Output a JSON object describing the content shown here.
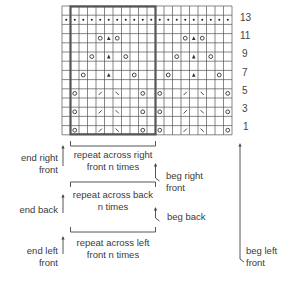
{
  "chart": {
    "columns": 20,
    "rows": 14,
    "repeat": {
      "start_col": 1,
      "end_col": 10
    },
    "row_numbers": [
      "13",
      "11",
      "9",
      "7",
      "5",
      "3",
      "1"
    ],
    "symbols": {
      "dot": "purl / bobble dot",
      "o": "yarn over",
      "a": "double decrease",
      "slash": "k2tog",
      "backslash": "ssk"
    },
    "pattern_rows": [
      {
        "row": 14,
        "cells": ""
      },
      {
        "row": 13,
        "cells": "dots-all"
      },
      {
        "row": 12,
        "cells": ""
      },
      {
        "row": 11,
        "cells": "O col 4,14; A col 5,15; O col 6,16"
      },
      {
        "row": 10,
        "cells": ""
      },
      {
        "row": 9,
        "cells": "O col 3,13; A col 5,15; O col 7,17"
      },
      {
        "row": 8,
        "cells": ""
      },
      {
        "row": 7,
        "cells": "O col 2,12; A col 5,15; O col 8,18"
      },
      {
        "row": 6,
        "cells": ""
      },
      {
        "row": 5,
        "cells": "O col 1,11; / col 4,14; \\ col 6,16; O col 9,19"
      },
      {
        "row": 4,
        "cells": ""
      },
      {
        "row": 3,
        "cells": "O col 1,11; / col 4,14; \\ col 6,16; O col 9,19"
      },
      {
        "row": 2,
        "cells": ""
      },
      {
        "row": 1,
        "cells": "O col 1,11; / col 4,14; \\ col 6,16; O col 9,19"
      }
    ]
  },
  "labels": {
    "end_right_front": [
      "end right",
      "front"
    ],
    "repeat_right_front": [
      "repeat across right",
      "front n times"
    ],
    "beg_right_front": [
      "beg right",
      "front"
    ],
    "repeat_back": [
      "repeat across back",
      "n times"
    ],
    "end_back": [
      "end back"
    ],
    "beg_back": [
      "beg back"
    ],
    "repeat_left_front": [
      "repeat across left",
      "front n times"
    ],
    "end_left_front": [
      "end left",
      "front"
    ],
    "beg_left_front": [
      "beg left",
      "front"
    ]
  },
  "colors": {
    "grid_line": "#555555",
    "grid_light": "#bdbdbd",
    "repeat_box": "#555555",
    "text": "#3a3a3a"
  }
}
